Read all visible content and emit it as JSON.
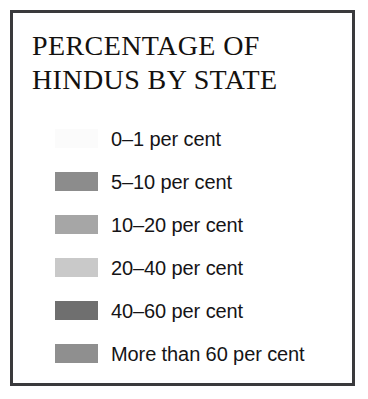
{
  "card": {
    "border_color": "#3a3a3c",
    "background_color": "#ffffff"
  },
  "title": {
    "line1": "Percentage of",
    "line2": "Hindus by State",
    "color": "#14110f"
  },
  "legend": {
    "items": [
      {
        "label": "0–1 per cent",
        "color": "#fbfbfb",
        "range_min": 0,
        "range_max": 1
      },
      {
        "label": "5–10 per cent",
        "color": "#8c8c8c",
        "range_min": 5,
        "range_max": 10
      },
      {
        "label": "10–20 per cent",
        "color": "#a6a6a6",
        "range_min": 10,
        "range_max": 20
      },
      {
        "label": "20–40 per cent",
        "color": "#c9c9c9",
        "range_min": 20,
        "range_max": 40
      },
      {
        "label": "40–60 per cent",
        "color": "#6f6f6f",
        "range_min": 40,
        "range_max": 60
      },
      {
        "label": "More than 60 per cent",
        "color": "#8f8f8f",
        "range_min": 60,
        "range_max": 100
      }
    ]
  }
}
